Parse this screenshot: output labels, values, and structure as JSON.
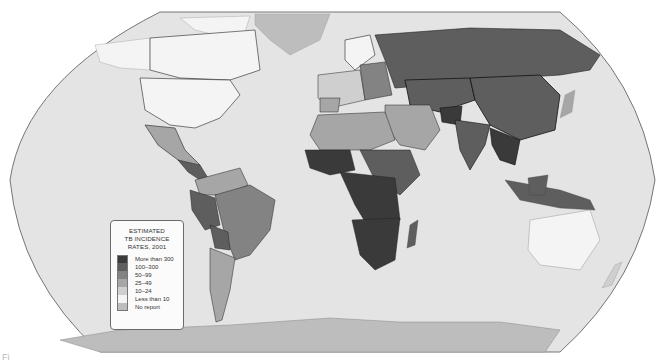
{
  "map": {
    "title_lines": [
      "ESTIMATED",
      "TB INCIDENCE",
      "RATES, 2001"
    ],
    "projection": "Robinson-like world",
    "ocean_color": "#e4e4e4",
    "border_color": "#111111",
    "legend": {
      "title": "ESTIMATED TB INCIDENCE RATES, 2001",
      "items": [
        {
          "label": "More than 300",
          "color": "#3a3a3a"
        },
        {
          "label": "100–300",
          "color": "#5e5e5e"
        },
        {
          "label": "50–99",
          "color": "#838383"
        },
        {
          "label": "25–49",
          "color": "#a6a6a6"
        },
        {
          "label": "10–24",
          "color": "#cfcfcf"
        },
        {
          "label": "Less than 10",
          "color": "#f4f4f4"
        },
        {
          "label": "No report",
          "color": "#bdbdbd"
        }
      ]
    },
    "regions": [
      {
        "name": "Russia",
        "category": "100–300"
      },
      {
        "name": "China",
        "category": "100–300"
      },
      {
        "name": "India",
        "category": "100–300"
      },
      {
        "name": "Southeast Asia",
        "category": "100–300"
      },
      {
        "name": "Indonesia",
        "category": "100–300"
      },
      {
        "name": "Sub-Saharan Africa",
        "category": "More than 300"
      },
      {
        "name": "Central Africa",
        "category": "100–300"
      },
      {
        "name": "Madagascar",
        "category": "100–300"
      },
      {
        "name": "North Africa",
        "category": "25–49"
      },
      {
        "name": "Middle East",
        "category": "25–49"
      },
      {
        "name": "Western Europe",
        "category": "10–24"
      },
      {
        "name": "United States",
        "category": "Less than 10"
      },
      {
        "name": "Canada",
        "category": "Less than 10"
      },
      {
        "name": "Australia",
        "category": "Less than 10"
      },
      {
        "name": "Mexico",
        "category": "25–49"
      },
      {
        "name": "Brazil",
        "category": "50–99"
      },
      {
        "name": "Peru / Bolivia",
        "category": "100–300"
      },
      {
        "name": "Argentina / Chile",
        "category": "25–49"
      },
      {
        "name": "Greenland",
        "category": "No report"
      },
      {
        "name": "Antarctica",
        "category": "No report"
      },
      {
        "name": "Japan",
        "category": "25–49"
      }
    ]
  },
  "figure_label": "Fi"
}
